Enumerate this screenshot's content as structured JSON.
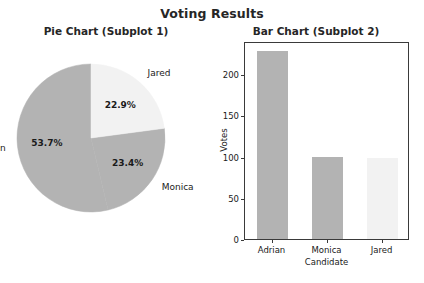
{
  "figure": {
    "suptitle": "Voting Results"
  },
  "chart_data": [
    {
      "type": "pie",
      "title": "Pie Chart (Subplot 1)",
      "labels": [
        "Adrian",
        "Monica",
        "Jared"
      ],
      "values": [
        228,
        100,
        98
      ],
      "percent_labels": [
        "53.7%",
        "23.4%",
        "22.9%"
      ],
      "percents": [
        53.7,
        23.4,
        22.9
      ],
      "colors": [
        "#b3b3b3",
        "#b3b3b3",
        "#f2f2f2"
      ],
      "startangle": 90,
      "counterclock": true,
      "legend": "none"
    },
    {
      "type": "bar",
      "title": "Bar Chart (Subplot 2)",
      "categories": [
        "Adrian",
        "Monica",
        "Jared"
      ],
      "values": [
        228,
        100,
        98
      ],
      "colors": [
        "#b3b3b3",
        "#b3b3b3",
        "#f2f2f2"
      ],
      "xlabel": "Candidate",
      "ylabel": "Votes",
      "yticks": [
        0,
        50,
        100,
        150,
        200
      ],
      "ytick_labels": [
        "0",
        "50",
        "100",
        "150",
        "200"
      ],
      "ylim": [
        0,
        240
      ],
      "grid": false,
      "legend": "none"
    }
  ]
}
